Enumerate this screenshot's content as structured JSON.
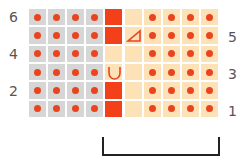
{
  "chart": {
    "row_labels_left": [
      "6",
      "4",
      "2"
    ],
    "row_labels_right": [
      "5",
      "3",
      "1"
    ],
    "columns": 10,
    "rows": 6,
    "colors": {
      "gray": "#d6d6d6",
      "peach": "#fde2b8",
      "red": "#f2401a",
      "dot": "#e9441f",
      "bracket": "#222222"
    },
    "symbols": {
      "triangle": "decrease-triangle-icon",
      "u": "yarn-over-u-icon"
    }
  }
}
